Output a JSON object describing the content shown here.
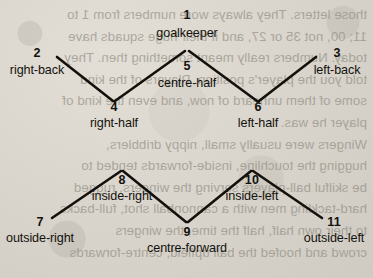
{
  "diagram": {
    "type": "football-formation",
    "formation_name": "2-3-5 pyramid",
    "positions": [
      {
        "id": "goalkeeper",
        "number": "1",
        "label": "goalkeeper",
        "x": 187,
        "y": 14,
        "num_y": 9,
        "label_y": 26,
        "faint": true
      },
      {
        "id": "right-back",
        "number": "2",
        "label": "right-back",
        "x": 37,
        "y": 55,
        "num_y": 47,
        "label_y": 63,
        "faint": false
      },
      {
        "id": "left-back",
        "number": "3",
        "label": "left-back",
        "x": 337,
        "y": 55,
        "num_y": 47,
        "label_y": 63,
        "faint": false
      },
      {
        "id": "centre-half",
        "number": "5",
        "label": "centre-half",
        "x": 187,
        "y": 50,
        "num_y": 60,
        "label_y": 76,
        "faint": false
      },
      {
        "id": "right-half",
        "number": "4",
        "label": "right-half",
        "x": 114,
        "y": 100,
        "num_y": 101,
        "label_y": 116,
        "faint": false
      },
      {
        "id": "left-half",
        "number": "6",
        "label": "left-half",
        "x": 258,
        "y": 100,
        "num_y": 101,
        "label_y": 116,
        "faint": false
      },
      {
        "id": "inside-right",
        "number": "8",
        "label": "inside-right",
        "x": 122,
        "y": 170,
        "num_y": 174,
        "label_y": 189,
        "faint": false
      },
      {
        "id": "inside-left",
        "number": "10",
        "label": "inside-left",
        "x": 252,
        "y": 170,
        "num_y": 174,
        "label_y": 189,
        "faint": false
      },
      {
        "id": "outside-right",
        "number": "7",
        "label": "outside-right",
        "x": 40,
        "y": 223,
        "num_y": 216,
        "label_y": 231,
        "faint": false
      },
      {
        "id": "outside-left",
        "number": "11",
        "label": "outside-left",
        "x": 334,
        "y": 223,
        "num_y": 216,
        "label_y": 231,
        "faint": false
      },
      {
        "id": "centre-forward",
        "number": "9",
        "label": "centre-forward",
        "x": 187,
        "y": 221,
        "num_y": 226,
        "label_y": 241,
        "faint": false
      }
    ],
    "connections": [
      {
        "from": "right-back",
        "to": "right-half",
        "x1": 57,
        "y1": 57,
        "x2": 113,
        "y2": 101
      },
      {
        "from": "right-half",
        "to": "centre-half",
        "x1": 115,
        "y1": 101,
        "x2": 185,
        "y2": 51
      },
      {
        "from": "centre-half",
        "to": "left-half",
        "x1": 189,
        "y1": 51,
        "x2": 257,
        "y2": 101
      },
      {
        "from": "left-half",
        "to": "left-back",
        "x1": 259,
        "y1": 101,
        "x2": 316,
        "y2": 57
      },
      {
        "from": "outside-right",
        "to": "inside-right",
        "x1": 52,
        "y1": 218,
        "x2": 121,
        "y2": 171
      },
      {
        "from": "inside-right",
        "to": "centre-forward",
        "x1": 123,
        "y1": 171,
        "x2": 186,
        "y2": 222
      },
      {
        "from": "centre-forward",
        "to": "inside-left",
        "x1": 188,
        "y1": 222,
        "x2": 251,
        "y2": 171
      },
      {
        "from": "inside-left",
        "to": "outside-left",
        "x1": 253,
        "y1": 171,
        "x2": 322,
        "y2": 218
      }
    ],
    "ink_color": "#14110d",
    "paper_color": "#dcd8d0"
  },
  "bleed_through": {
    "note": "mirrored show-through text from the reverse side of the page",
    "lines": [
      "those letters. They always wore numbers from 1 to",
      "11; 00, not 35 or 27, and if their huge squads have",
      "today. Numbers really meant something then. They",
      "told you the player's position. Players of the kind",
      "some of them unheard of now, and even the kind of",
      "player he was.",
      "Wingers were usually small, nippy dribblers,",
      "hugging the touchline, inside-forwards tended to",
      "be skilful ball-players serving the wingers, rugged",
      "hard-tackling men with a cannonball shot, full-backs",
      "to their own half, half the time, the wingers",
      "crowd and hoofed the ball upfield, centre-forwards"
    ]
  }
}
